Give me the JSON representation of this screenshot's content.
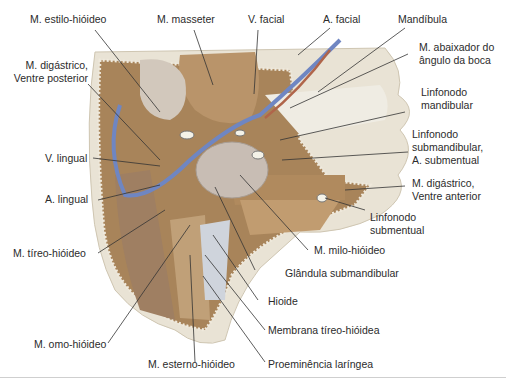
{
  "figure": {
    "colors": {
      "background": "#ffffff",
      "skin": "#e8e2d4",
      "muscle": "#b08a5e",
      "muscle_dark": "#8a6a48",
      "vein": "#6f86c2",
      "artery": "#b0654a",
      "gland": "#c9bfb6",
      "node": "#f4f2e8",
      "leader": "#333333"
    }
  },
  "labels": {
    "estilo_hioideo": "M. estilo-hióideo",
    "masseter": "M. masseter",
    "v_facial": "V. facial",
    "a_facial": "A. facial",
    "mandibula": "Mandíbula",
    "abaixador_1": "M. abaixador do",
    "abaixador_2": "ângulo da boca",
    "digastrico_post_1": "M. digástrico,",
    "digastrico_post_2": "Ventre posterior",
    "linf_mand_1": "Linfonodo",
    "linf_mand_2": "mandibular",
    "linf_submand_1": "Linfonodo",
    "linf_submand_2": "submandibular,",
    "linf_submand_3": "A. submentual",
    "v_lingual": "V. lingual",
    "a_lingual": "A. lingual",
    "digastrico_ant_1": "M. digástrico,",
    "digastrico_ant_2": "Ventre anterior",
    "linf_subm_1": "Linfonodo",
    "linf_subm_2": "submentual",
    "tireo_hioideo": "M. tíreo-hióideo",
    "milo_hioideo": "M. milo-hióideo",
    "glandula": "Glândula submandibular",
    "hioide": "Hioide",
    "membrana": "Membrana tíreo-hióidea",
    "omo_hioideo": "M. omo-hióideo",
    "esterno_hioideo": "M. esterno-hióideo",
    "proeminencia": "Proeminência laríngea"
  }
}
